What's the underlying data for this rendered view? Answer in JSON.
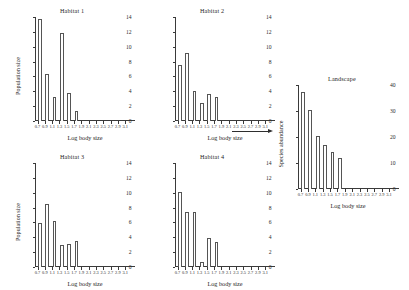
{
  "figure": {
    "xlabel": "Log body size",
    "ylabel_population": "Population size",
    "ylabel_landscape": "Species abundance",
    "arrow": "right-arrow"
  },
  "chart_data": [
    {
      "type": "bar",
      "title": "Habitat 1",
      "xlabel": "Log body size",
      "ylabel": "Population size",
      "categories": [
        "0.7",
        "0.9",
        "1.1",
        "1.3",
        "1.5",
        "1.7"
      ],
      "values": [
        13.7,
        6.3,
        3.3,
        11.8,
        3.8,
        1.4
      ],
      "xticks": [
        "0.7",
        "0.9",
        "1.1",
        "1.3",
        "1.5",
        "1.7",
        "1.9",
        "2.1",
        "2.3",
        "2.5",
        "2.7",
        "2.9",
        "3.1"
      ],
      "yticks": [
        0,
        2,
        4,
        6,
        8,
        10,
        12,
        14
      ],
      "ylim": [
        0,
        14
      ],
      "grid": false,
      "legend": "none"
    },
    {
      "type": "bar",
      "title": "Habitat 2",
      "xlabel": "Log body size",
      "ylabel": "",
      "categories": [
        "0.7",
        "0.9",
        "1.1",
        "1.3",
        "1.5",
        "1.7"
      ],
      "values": [
        7.5,
        9.2,
        4.1,
        2.4,
        3.6,
        3.3
      ],
      "xticks": [
        "0.7",
        "0.9",
        "1.1",
        "1.3",
        "1.5",
        "1.7",
        "1.9",
        "2.1",
        "2.3",
        "2.5",
        "2.7",
        "2.9",
        "3.1"
      ],
      "yticks": [
        0,
        2,
        4,
        6,
        8,
        10,
        12,
        14
      ],
      "ylim": [
        0,
        14
      ],
      "grid": false,
      "legend": "none"
    },
    {
      "type": "bar",
      "title": "Habitat 3",
      "xlabel": "Log body size",
      "ylabel": "Population size",
      "categories": [
        "0.7",
        "0.9",
        "1.1",
        "1.3",
        "1.5",
        "1.7"
      ],
      "values": [
        5.9,
        8.5,
        6.2,
        2.9,
        3.1,
        3.5
      ],
      "xticks": [
        "0.7",
        "0.9",
        "1.1",
        "1.3",
        "1.5",
        "1.7",
        "1.9",
        "2.1",
        "2.3",
        "2.5",
        "2.7",
        "2.9",
        "3.1"
      ],
      "yticks": [
        0,
        2,
        4,
        6,
        8,
        10,
        12,
        14
      ],
      "ylim": [
        0,
        14
      ],
      "grid": false,
      "legend": "none"
    },
    {
      "type": "bar",
      "title": "Habitat 4",
      "xlabel": "Log body size",
      "ylabel": "",
      "categories": [
        "0.7",
        "0.9",
        "1.1",
        "1.3",
        "1.5",
        "1.7"
      ],
      "values": [
        10.1,
        7.4,
        7.4,
        0.7,
        3.9,
        3.4
      ],
      "xticks": [
        "0.7",
        "0.9",
        "1.1",
        "1.3",
        "1.5",
        "1.7",
        "1.9",
        "2.1",
        "2.3",
        "2.5",
        "2.7",
        "2.9",
        "3.1"
      ],
      "yticks": [
        0,
        2,
        4,
        6,
        8,
        10,
        12,
        14
      ],
      "ylim": [
        0,
        14
      ],
      "grid": false,
      "legend": "none"
    },
    {
      "type": "bar",
      "title": "Landscape",
      "xlabel": "Log body size",
      "ylabel": "Species abundance",
      "categories": [
        "0.7",
        "0.9",
        "1.1",
        "1.3",
        "1.5",
        "1.7"
      ],
      "values": [
        37.5,
        30.5,
        20.5,
        16.8,
        14.2,
        12.0
      ],
      "xticks": [
        "0.7",
        "0.9",
        "1.1",
        "1.3",
        "1.5",
        "1.7",
        "1.9",
        "2.1",
        "2.3",
        "2.5",
        "2.7",
        "2.9",
        "3.1"
      ],
      "yticks": [
        0,
        10,
        20,
        30,
        40
      ],
      "ylim": [
        0,
        40
      ],
      "grid": false,
      "legend": "none"
    }
  ]
}
